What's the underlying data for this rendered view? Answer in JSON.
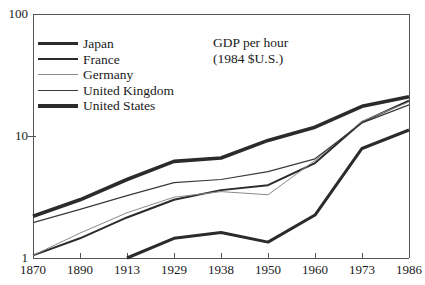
{
  "chart_data": {
    "type": "line",
    "title": "GDP per hour",
    "subtitle": "(1984 $U.S.)",
    "xlabel": "",
    "ylabel": "",
    "yscale": "log",
    "ylim": [
      1,
      100
    ],
    "ytick_labels": [
      "1",
      "10",
      "100"
    ],
    "ytick_values": [
      1,
      10,
      100
    ],
    "grid": false,
    "legend_position": "upper-left",
    "categories": [
      "1870",
      "1890",
      "1913",
      "1929",
      "1938",
      "1950",
      "1960",
      "1973",
      "1986"
    ],
    "x": [
      1870,
      1890,
      1913,
      1929,
      1938,
      1950,
      1960,
      1973,
      1986
    ],
    "series": [
      {
        "name": "Japan",
        "color": "#2b2b2b",
        "width": 3.0,
        "x": [
          1913,
          1929,
          1938,
          1950,
          1960,
          1973,
          1986
        ],
        "values": [
          1.0,
          1.45,
          1.62,
          1.35,
          2.25,
          7.9,
          11.2
        ]
      },
      {
        "name": "France",
        "color": "#2b2b2b",
        "width": 2.0,
        "x": [
          1870,
          1890,
          1913,
          1929,
          1938,
          1950,
          1960,
          1973,
          1986
        ],
        "values": [
          1.05,
          1.45,
          2.15,
          3.0,
          3.6,
          3.95,
          6.0,
          13.0,
          19.5
        ]
      },
      {
        "name": "Germany",
        "color": "#8a8a8a",
        "width": 1.0,
        "x": [
          1870,
          1890,
          1913,
          1929,
          1938,
          1950,
          1960,
          1973,
          1986
        ],
        "values": [
          1.05,
          1.6,
          2.35,
          3.15,
          3.5,
          3.3,
          6.3,
          13.2,
          19.0
        ]
      },
      {
        "name": "United Kingdom",
        "color": "#3a3a3a",
        "width": 1.2,
        "x": [
          1870,
          1890,
          1913,
          1929,
          1938,
          1950,
          1960,
          1973,
          1986
        ],
        "values": [
          1.95,
          2.5,
          3.25,
          4.15,
          4.4,
          5.1,
          6.5,
          12.8,
          18.0
        ]
      },
      {
        "name": "United States",
        "color": "#2b2b2b",
        "width": 3.6,
        "x": [
          1870,
          1890,
          1913,
          1929,
          1938,
          1950,
          1960,
          1973,
          1986
        ],
        "values": [
          2.2,
          3.0,
          4.4,
          6.2,
          6.6,
          9.2,
          11.8,
          17.5,
          21.0
        ]
      }
    ]
  },
  "axes": {
    "y_labels": [
      "100",
      "10",
      "1"
    ],
    "x_labels": [
      "1870",
      "1890",
      "1913",
      "1929",
      "1938",
      "1950",
      "1960",
      "1973",
      "1986"
    ]
  },
  "legend": {
    "items": [
      {
        "label": "Japan"
      },
      {
        "label": "France"
      },
      {
        "label": "Germany"
      },
      {
        "label": "United Kingdom"
      },
      {
        "label": "United States"
      }
    ]
  },
  "annotation": {
    "title": "GDP per hour",
    "subtitle": "(1984 $U.S.)"
  },
  "colors": {
    "axis": "#555555",
    "ink": "#1a1a1a",
    "light_line": "#8a8a8a"
  }
}
